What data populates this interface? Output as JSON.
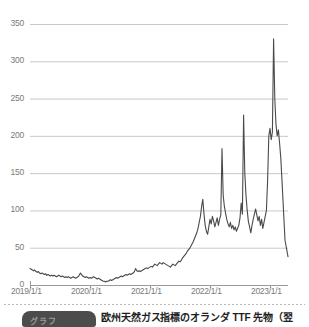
{
  "chart_data": {
    "type": "line",
    "title": "",
    "subtitle": "",
    "xlabel": "",
    "ylabel": "",
    "xlim": [
      "2019/1/1",
      "2023/5/1"
    ],
    "ylim": [
      0,
      350
    ],
    "grid": true,
    "legend": "none",
    "line_color": "#4a4a4a",
    "grid_color": "#c9c9c9",
    "axis_color": "#9a9a9a",
    "background": "#ffffff",
    "y_ticks": [
      0,
      50,
      100,
      150,
      200,
      250,
      300,
      350
    ],
    "y_tick_labels": [
      "0",
      "50",
      "100",
      "150",
      "200",
      "250",
      "300",
      "350"
    ],
    "x_ticks": [
      "2019/1/1",
      "2020/1/1",
      "2021/1/1",
      "2022/1/1",
      "2023/1/1"
    ],
    "x_tick_labels": [
      "2019/1/1",
      "2020/1/1",
      "2021/1/1",
      "2022/1/1",
      "2023/1/1"
    ],
    "series": [
      {
        "name": "Dutch TTF natural gas futures",
        "x": [
          0.0,
          0.02,
          0.04,
          0.06,
          0.08,
          0.1,
          0.12,
          0.14,
          0.16,
          0.18,
          0.2,
          0.22,
          0.24,
          0.26,
          0.28,
          0.3,
          0.32,
          0.34,
          0.36,
          0.38,
          0.4,
          0.42,
          0.44,
          0.46,
          0.48,
          0.5,
          0.52,
          0.54,
          0.56,
          0.58,
          0.6,
          0.62,
          0.64,
          0.66,
          0.68,
          0.7,
          0.72,
          0.74,
          0.76,
          0.78,
          0.8,
          0.82,
          0.84,
          0.86,
          0.88,
          0.9,
          0.92,
          0.94,
          0.96,
          0.98,
          1.0,
          1.02,
          1.04,
          1.06,
          1.08,
          1.1,
          1.12,
          1.14,
          1.16,
          1.18,
          1.2,
          1.22,
          1.24,
          1.26,
          1.28,
          1.3,
          1.32,
          1.34,
          1.36,
          1.38,
          1.4,
          1.42,
          1.44,
          1.46,
          1.48,
          1.5,
          1.52,
          1.54,
          1.56,
          1.58,
          1.6,
          1.62,
          1.64,
          1.66,
          1.68,
          1.7,
          1.72,
          1.74,
          1.76,
          1.78,
          1.8,
          1.82,
          1.84,
          1.86,
          1.88,
          1.9,
          1.92,
          1.94,
          1.96,
          1.98,
          2.0,
          2.02,
          2.04,
          2.06,
          2.08,
          2.1,
          2.12,
          2.14,
          2.16,
          2.18,
          2.2,
          2.22,
          2.24,
          2.26,
          2.28,
          2.3,
          2.32,
          2.34,
          2.36,
          2.38,
          2.4,
          2.42,
          2.44,
          2.46,
          2.48,
          2.5,
          2.52,
          2.54,
          2.56,
          2.58,
          2.6,
          2.62,
          2.64,
          2.66,
          2.68,
          2.7,
          2.72,
          2.74,
          2.76,
          2.78,
          2.8,
          2.82,
          2.84,
          2.86,
          2.88,
          2.9,
          2.92,
          2.94,
          2.96,
          2.98,
          3.0,
          3.02,
          3.04,
          3.06,
          3.08,
          3.1,
          3.12,
          3.14,
          3.16,
          3.18,
          3.2,
          3.22,
          3.24,
          3.26,
          3.28,
          3.3,
          3.32,
          3.34,
          3.36,
          3.38,
          3.4,
          3.42,
          3.44,
          3.46,
          3.48,
          3.5,
          3.52,
          3.54,
          3.56,
          3.58,
          3.6,
          3.62,
          3.64,
          3.66,
          3.68,
          3.7,
          3.72,
          3.74,
          3.76,
          3.78,
          3.8,
          3.82,
          3.84,
          3.86,
          3.88,
          3.9,
          3.92,
          3.94,
          3.96,
          3.98,
          4.0,
          4.02,
          4.04,
          4.06,
          4.08,
          4.1,
          4.12,
          4.14,
          4.16,
          4.18,
          4.2,
          4.25,
          4.3
        ],
        "values": [
          22,
          21,
          20,
          19,
          20,
          18,
          17,
          18,
          16,
          15,
          16,
          15,
          14,
          15,
          13,
          14,
          13,
          12,
          13,
          12,
          13,
          12,
          11,
          12,
          13,
          12,
          11,
          12,
          11,
          10,
          11,
          10,
          11,
          10,
          9,
          10,
          11,
          10,
          9,
          10,
          11,
          13,
          16,
          14,
          12,
          11,
          10,
          11,
          10,
          9,
          10,
          9,
          10,
          11,
          10,
          9,
          8,
          9,
          8,
          7,
          6,
          5,
          5,
          4,
          5,
          5,
          6,
          7,
          6,
          7,
          8,
          9,
          10,
          9,
          10,
          11,
          12,
          11,
          12,
          13,
          14,
          13,
          14,
          15,
          14,
          15,
          16,
          18,
          22,
          19,
          18,
          19,
          18,
          19,
          20,
          21,
          22,
          23,
          22,
          23,
          24,
          25,
          24,
          26,
          28,
          27,
          26,
          28,
          30,
          29,
          28,
          30,
          29,
          28,
          27,
          26,
          25,
          24,
          26,
          28,
          27,
          26,
          28,
          30,
          32,
          31,
          33,
          36,
          38,
          40,
          42,
          45,
          47,
          49,
          52,
          55,
          58,
          62,
          66,
          70,
          76,
          84,
          92,
          105,
          115,
          95,
          80,
          72,
          68,
          78,
          88,
          82,
          92,
          86,
          78,
          84,
          90,
          80,
          88,
          94,
          183,
          120,
          105,
          96,
          88,
          82,
          78,
          84,
          76,
          80,
          74,
          78,
          72,
          76,
          80,
          90,
          110,
          95,
          228,
          150,
          120,
          100,
          85,
          78,
          70,
          80,
          88,
          95,
          102,
          94,
          86,
          92,
          80,
          88,
          76,
          84,
          92,
          100,
          140,
          200,
          210,
          195,
          205,
          330,
          250,
          215,
          200,
          208,
          190,
          170,
          140,
          60,
          38
        ]
      }
    ],
    "peak_value": 330,
    "peak_label": "2022 peak",
    "min_value": 4,
    "end_value": 38
  },
  "caption": {
    "badge_label": "グラフ",
    "text": "欧州天然ガス指標のオランダ TTF 先物（翌"
  }
}
